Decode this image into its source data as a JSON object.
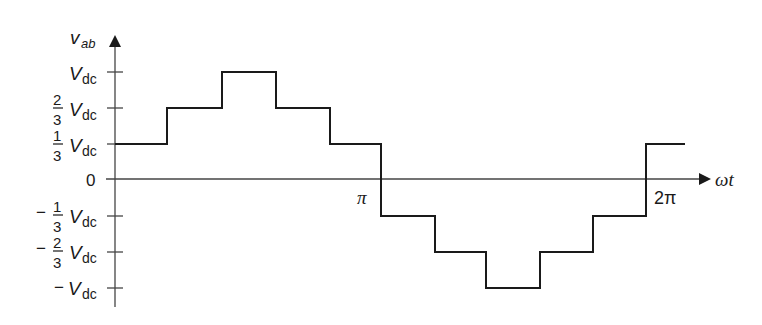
{
  "diagram": {
    "type": "stepped-waveform",
    "y_axis": {
      "label_main": "v",
      "label_sub": "ab",
      "ticks": [
        {
          "id": "vdc",
          "sign": "",
          "num": "",
          "den": "",
          "sym": "V",
          "sub": "dc",
          "value": 1
        },
        {
          "id": "two-thirds",
          "sign": "",
          "num": "2",
          "den": "3",
          "sym": "V",
          "sub": "dc",
          "value": 0.6667
        },
        {
          "id": "one-third",
          "sign": "",
          "num": "1",
          "den": "3",
          "sym": "V",
          "sub": "dc",
          "value": 0.3333
        },
        {
          "id": "zero",
          "text": "0",
          "value": 0
        },
        {
          "id": "neg-one-third",
          "sign": "−",
          "num": "1",
          "den": "3",
          "sym": "V",
          "sub": "dc",
          "value": -0.3333
        },
        {
          "id": "neg-two-thirds",
          "sign": "−",
          "num": "2",
          "den": "3",
          "sym": "V",
          "sub": "dc",
          "value": -0.6667
        },
        {
          "id": "neg-vdc",
          "sign": "−",
          "num": "",
          "den": "",
          "sym": "V",
          "sub": "dc",
          "value": -1
        }
      ]
    },
    "x_axis": {
      "label": "ωt",
      "ticks": [
        {
          "id": "pi",
          "text": "π"
        },
        {
          "id": "two-pi",
          "text": "2π"
        }
      ]
    },
    "waveform_levels_in_vdc": [
      "1/3",
      "2/3",
      "1",
      "2/3",
      "1/3",
      "-1/3",
      "-2/3",
      "-1",
      "-2/3",
      "-1/3",
      "1/3"
    ],
    "colors": {
      "line": "#1a1a1a",
      "background": "#ffffff"
    }
  }
}
